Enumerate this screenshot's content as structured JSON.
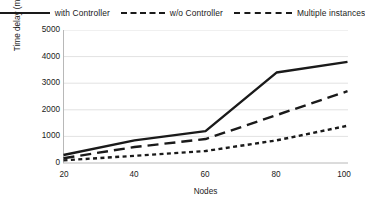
{
  "chart_data": {
    "type": "line",
    "title": "",
    "xlabel": "Nodes",
    "ylabel": "Time delay (ms)",
    "x": [
      20,
      40,
      60,
      80,
      100
    ],
    "categories": [
      "20",
      "40",
      "60",
      "80",
      "100"
    ],
    "xlim": [
      20,
      100
    ],
    "ylim": [
      0,
      5000
    ],
    "ytick_labels": [
      "0",
      "1000",
      "2000",
      "3000",
      "4000",
      "5000"
    ],
    "ytick_values": [
      0,
      1000,
      2000,
      3000,
      4000,
      5000
    ],
    "xtick_labels": [
      "20",
      "40",
      "60",
      "80",
      "100"
    ],
    "xtick_values": [
      20,
      40,
      60,
      80,
      100
    ],
    "grid": "horizontal",
    "legend_position": "top",
    "series": [
      {
        "name": "with Controller",
        "style": "solid",
        "values": [
          300,
          850,
          1200,
          3400,
          3800
        ]
      },
      {
        "name": "w/o Controller",
        "style": "dotted",
        "values": [
          100,
          270,
          450,
          850,
          1400
        ]
      },
      {
        "name": "Multiple instances",
        "style": "dashed",
        "values": [
          180,
          600,
          900,
          1800,
          2700
        ]
      }
    ]
  },
  "legend": {
    "items": [
      {
        "label": "with Controller",
        "marker": "solid-line-swatch"
      },
      {
        "label": "w/o Controller",
        "marker": "dotted-line-swatch"
      },
      {
        "label": "Multiple instances",
        "marker": "dashed-line-swatch"
      }
    ]
  },
  "axes": {
    "y_title": "Time delay (ms)",
    "x_title": "Nodes",
    "y_ticks": [
      "5000",
      "4000",
      "3000",
      "2000",
      "1000",
      "0"
    ],
    "x_ticks": [
      "20",
      "40",
      "60",
      "80",
      "100"
    ]
  },
  "colors": {
    "line": "#1a1a1a",
    "grid": "#e2e2e2",
    "axis": "#b4b4b4",
    "background": "#ffffff"
  }
}
